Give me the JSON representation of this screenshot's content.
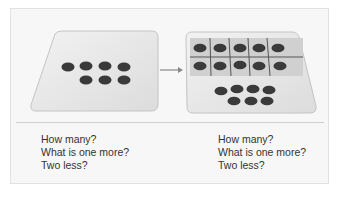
{
  "figure": {
    "left_panel": {
      "description": "Card with 7 counters arranged in two rows (4 on top, 3 below)",
      "counters_top_row": 4,
      "counters_bottom_row": 3,
      "questions": [
        "How many?",
        "What is one more?",
        "Two less?"
      ]
    },
    "arrow": {
      "direction": "right"
    },
    "right_panel": {
      "description": "Card with a filled ten-frame (2x5) above 7 counters (4 on top, 3 below)",
      "ten_frame": {
        "rows": 2,
        "cols": 5,
        "filled": 10
      },
      "counters_top_row": 4,
      "counters_bottom_row": 3,
      "questions": [
        "How many?",
        "What is one more?",
        "Two less?"
      ]
    },
    "colors": {
      "frame_background": "#f7f7f7",
      "card_fill": "#e6e6e6",
      "counter": "#3a3a3a",
      "grid_line": "#555555",
      "text": "#333333"
    }
  }
}
